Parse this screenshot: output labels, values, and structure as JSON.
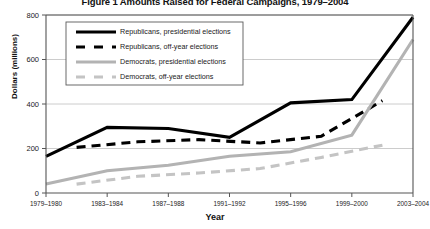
{
  "chart_data": {
    "type": "line",
    "title": "Figure 1 Amounts Raised for Federal Campaigns, 1979–2004",
    "xlabel": "Year",
    "ylabel": "Dollars (millions)",
    "ylim": [
      0,
      800
    ],
    "yticks": [
      0,
      200,
      400,
      600,
      800
    ],
    "grid": true,
    "legend_position": "upper-left-inside",
    "categories": [
      "1979–1980",
      "1981–1982",
      "1983–1984",
      "1985–1986",
      "1987–1988",
      "1989–1990",
      "1991–1992",
      "1993–1994",
      "1995–1996",
      "1997–1998",
      "1999–2000",
      "2001–2002",
      "2003–2004"
    ],
    "xtick_labels": [
      "1979–1980",
      "1983–1984",
      "1987–1988",
      "1991–1992",
      "1995–1996",
      "1999–2000",
      "2003–2004"
    ],
    "series": [
      {
        "name": "Republicans, presidential elections",
        "key": "rep_pres",
        "color": "#000000",
        "style": "solid",
        "width": 3.1,
        "x": [
          "1979–1980",
          "1983–1984",
          "1987–1988",
          "1991–1992",
          "1995–1996",
          "1999–2000",
          "2003–2004"
        ],
        "values": [
          165,
          295,
          290,
          250,
          405,
          420,
          790
        ]
      },
      {
        "name": "Republicans, off-year elections",
        "key": "rep_off",
        "color": "#000000",
        "style": "dashed",
        "width": 3.1,
        "x": [
          "1981–1982",
          "1985–1986",
          "1989–1990",
          "1993–1994",
          "1997–1998",
          "2001–2002"
        ],
        "values": [
          205,
          230,
          240,
          225,
          255,
          415
        ]
      },
      {
        "name": "Democrats, presidential elections",
        "key": "dem_pres",
        "color": "#b3b3b3",
        "style": "solid",
        "width": 3.1,
        "x": [
          "1979–1980",
          "1983–1984",
          "1987–1988",
          "1991–1992",
          "1995–1996",
          "1999–2000",
          "2003–2004"
        ],
        "values": [
          40,
          100,
          125,
          165,
          185,
          260,
          690
        ]
      },
      {
        "name": "Democrats, off-year elections",
        "key": "dem_off",
        "color": "#c4c4c4",
        "style": "dashed",
        "width": 3.1,
        "x": [
          "1981–1982",
          "1985–1986",
          "1989–1990",
          "1993–1994",
          "1997–1998",
          "2001–2002"
        ],
        "values": [
          40,
          75,
          90,
          110,
          160,
          215
        ]
      }
    ]
  },
  "legend": {
    "items": [
      {
        "label": "Republicans, presidential elections"
      },
      {
        "label": "Republicans, off-year elections"
      },
      {
        "label": "Democrats, presidential elections"
      },
      {
        "label": "Democrats, off-year elections"
      }
    ]
  }
}
